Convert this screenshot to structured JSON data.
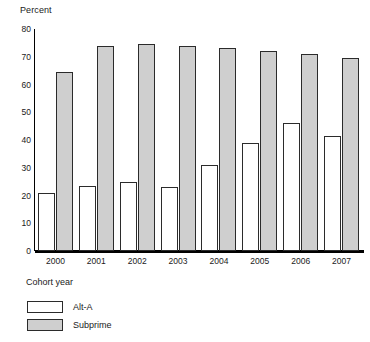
{
  "chart_data": {
    "type": "bar",
    "title": "",
    "xlabel": "Cohort year",
    "ylabel": "Percent",
    "categories": [
      "2000",
      "2001",
      "2002",
      "2003",
      "2004",
      "2005",
      "2006",
      "2007"
    ],
    "series": [
      {
        "name": "Alt-A",
        "values": [
          21,
          23.5,
          25,
          23,
          31,
          39,
          46,
          41.5
        ],
        "color": "#ffffff"
      },
      {
        "name": "Subprime",
        "values": [
          64.5,
          74,
          74.5,
          74,
          73,
          72,
          71,
          69.5
        ],
        "color": "#cfcfcf"
      }
    ],
    "ylim": [
      0,
      80
    ],
    "yticks": [
      "0",
      "10",
      "20",
      "30",
      "40",
      "50",
      "60",
      "70",
      "80"
    ],
    "ytick_values": [
      0,
      10,
      20,
      30,
      40,
      50,
      60,
      70,
      80
    ],
    "grid": false,
    "legend_position": "bottom-left"
  },
  "axes": {
    "y_title": "Percent",
    "x_title": "Cohort year"
  },
  "legend": {
    "items": [
      {
        "label": "Alt-A"
      },
      {
        "label": "Subprime"
      }
    ]
  }
}
